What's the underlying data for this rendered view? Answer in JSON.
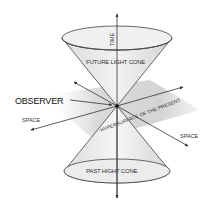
{
  "diagram": {
    "type": "light-cone",
    "labels": {
      "time": "TIME",
      "future_cone": "FUTURE LIGHT CONE",
      "observer": "OBSERVER",
      "space_left": "SPACE",
      "space_right": "SPACE",
      "hypersurface": "HYPERSURFACE OF THE PRESENT",
      "past_cone": "PAST HIGHT CONE"
    },
    "colors": {
      "line": "#333333",
      "cone_fill": "#e6e6e6",
      "plane_fill": "#d9d9d9",
      "background": "#ffffff"
    }
  }
}
